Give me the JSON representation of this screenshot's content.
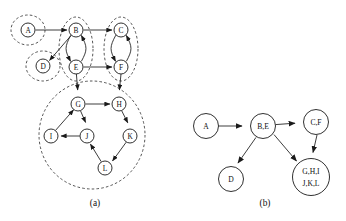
{
  "figure": {
    "background_color": "#ffffff",
    "line_color": "#1a1a1a",
    "panels": [
      {
        "id": "panel-a",
        "caption": "(a)"
      },
      {
        "id": "panel-b",
        "caption": "(b)"
      }
    ]
  },
  "panel_a": {
    "caption": "(a)",
    "nodes": [
      {
        "id": "A",
        "label": "A",
        "cx": 28,
        "cy": 30,
        "r": 7.0
      },
      {
        "id": "B",
        "label": "B",
        "cx": 76,
        "cy": 30,
        "r": 7.0
      },
      {
        "id": "C",
        "label": "C",
        "cx": 121,
        "cy": 30,
        "r": 7.0
      },
      {
        "id": "D",
        "label": "D",
        "cx": 43,
        "cy": 66,
        "r": 7.0
      },
      {
        "id": "E",
        "label": "E",
        "cx": 76,
        "cy": 67,
        "r": 7.0
      },
      {
        "id": "F",
        "label": "F",
        "cx": 121,
        "cy": 67,
        "r": 7.0
      },
      {
        "id": "G",
        "label": "G",
        "cx": 78,
        "cy": 104,
        "r": 7.0
      },
      {
        "id": "H",
        "label": "H",
        "cx": 119,
        "cy": 104,
        "r": 7.0
      },
      {
        "id": "I",
        "label": "I",
        "cx": 51,
        "cy": 136,
        "r": 7.0
      },
      {
        "id": "J",
        "label": "J",
        "cx": 87,
        "cy": 136,
        "r": 7.0
      },
      {
        "id": "K",
        "label": "K",
        "cx": 130,
        "cy": 136,
        "r": 7.0
      },
      {
        "id": "L",
        "label": "L",
        "cx": 105,
        "cy": 168,
        "r": 7.0
      }
    ],
    "edges": [
      {
        "from": "A",
        "to": "B",
        "kind": "straight"
      },
      {
        "from": "B",
        "to": "C",
        "kind": "straight"
      },
      {
        "from": "B",
        "to": "D",
        "kind": "straight"
      },
      {
        "from": "B",
        "to": "E",
        "kind": "curve-left"
      },
      {
        "from": "E",
        "to": "B",
        "kind": "curve-right"
      },
      {
        "from": "C",
        "to": "F",
        "kind": "curve-left"
      },
      {
        "from": "F",
        "to": "C",
        "kind": "curve-right"
      },
      {
        "from": "E",
        "to": "F",
        "kind": "straight"
      },
      {
        "from": "E",
        "to": "G",
        "kind": "straight"
      },
      {
        "from": "F",
        "to": "H",
        "kind": "straight"
      },
      {
        "from": "G",
        "to": "H",
        "kind": "straight"
      },
      {
        "from": "G",
        "to": "J",
        "kind": "straight"
      },
      {
        "from": "I",
        "to": "G",
        "kind": "straight"
      },
      {
        "from": "J",
        "to": "I",
        "kind": "straight"
      },
      {
        "from": "H",
        "to": "K",
        "kind": "straight"
      },
      {
        "from": "K",
        "to": "L",
        "kind": "straight"
      },
      {
        "from": "L",
        "to": "J",
        "kind": "straight"
      }
    ],
    "groups": [
      {
        "id": "group-a",
        "members": "A",
        "cx": 28,
        "cy": 30,
        "rx": 17,
        "ry": 15
      },
      {
        "id": "group-d",
        "members": "D",
        "cx": 43,
        "cy": 66,
        "rx": 17,
        "ry": 15
      },
      {
        "id": "group-be",
        "members": "B,E",
        "cx": 76,
        "cy": 49,
        "rx": 17,
        "ry": 32
      },
      {
        "id": "group-cf",
        "members": "C,F",
        "cx": 121,
        "cy": 49,
        "rx": 17,
        "ry": 32
      },
      {
        "id": "group-ghijkl",
        "members": "G,H,I,J,K,L",
        "cx": 92,
        "cy": 135,
        "rx": 53,
        "ry": 54
      }
    ]
  },
  "panel_b": {
    "caption": "(b)",
    "nodes": [
      {
        "id": "A",
        "label": "A",
        "cx": 206,
        "cy": 126,
        "r": 12.5,
        "multiline": false
      },
      {
        "id": "BE",
        "label": "B,E",
        "cx": 263,
        "cy": 126,
        "r": 12.5,
        "multiline": false
      },
      {
        "id": "CF",
        "label": "C,F",
        "cx": 316,
        "cy": 122,
        "r": 12.5,
        "multiline": false
      },
      {
        "id": "D",
        "label": "D",
        "cx": 231,
        "cy": 179,
        "r": 12.5,
        "multiline": false
      },
      {
        "id": "GHIJKL",
        "label": "G,H,I|J,K,L",
        "line1": "G,H,I",
        "line2": "J,K,L",
        "cx": 311,
        "cy": 177,
        "r": 18.5,
        "multiline": true
      }
    ],
    "edges": [
      {
        "from": "A",
        "to": "BE"
      },
      {
        "from": "BE",
        "to": "CF"
      },
      {
        "from": "BE",
        "to": "D"
      },
      {
        "from": "BE",
        "to": "GHIJKL"
      },
      {
        "from": "CF",
        "to": "GHIJKL"
      }
    ]
  }
}
